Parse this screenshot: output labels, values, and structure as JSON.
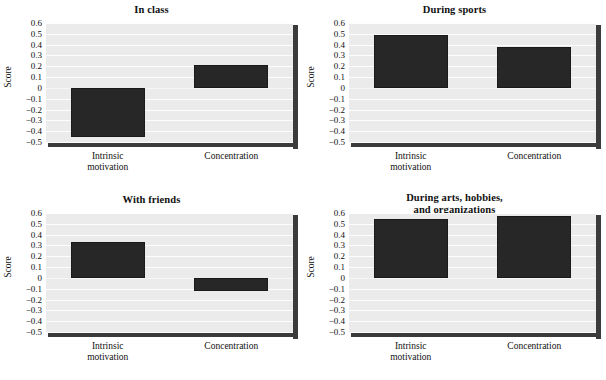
{
  "figure": {
    "background": "#ffffff",
    "plot_background": "#ebebeb",
    "bar_color": "#272727",
    "gridline_color": "#fdfdfd",
    "shadow_color": "#3b3b3b"
  },
  "chart_data": [
    {
      "type": "bar",
      "title": "In class",
      "title_lines": [
        "In class"
      ],
      "categories": [
        "Intrinsic motivation",
        "Concentration"
      ],
      "category_lines": [
        [
          "Intrinsic",
          "motivation"
        ],
        [
          "Concentration"
        ]
      ],
      "values": [
        -0.45,
        0.21
      ],
      "xlabel": "",
      "ylabel": "Score",
      "ylim": [
        -0.5,
        0.6
      ],
      "yticks": [
        0.6,
        0.5,
        0.4,
        0.3,
        0.2,
        0.1,
        0,
        -0.1,
        -0.2,
        -0.3,
        -0.4,
        -0.5
      ],
      "ytick_labels": [
        "0.6",
        "0.5",
        "0.4",
        "0.3",
        "0.2",
        "0.1",
        "0",
        "−0.1",
        "−0.2",
        "−0.3",
        "−0.4",
        "−0.5"
      ],
      "grid": true,
      "legend": false
    },
    {
      "type": "bar",
      "title": "During sports",
      "title_lines": [
        "During sports"
      ],
      "categories": [
        "Intrinsic motivation",
        "Concentration"
      ],
      "category_lines": [
        [
          "Intrinsic",
          "motivation"
        ],
        [
          "Concentration"
        ]
      ],
      "values": [
        0.49,
        0.38
      ],
      "xlabel": "",
      "ylabel": "Score",
      "ylim": [
        -0.5,
        0.6
      ],
      "yticks": [
        0.6,
        0.5,
        0.4,
        0.3,
        0.2,
        0.1,
        0,
        -0.1,
        -0.2,
        -0.3,
        -0.4,
        -0.5
      ],
      "ytick_labels": [
        "0.6",
        "0.5",
        "0.4",
        "0.3",
        "0.2",
        "0.1",
        "0",
        "−0.1",
        "−0.2",
        "−0.3",
        "−0.4",
        "−0.5"
      ],
      "grid": true,
      "legend": false
    },
    {
      "type": "bar",
      "title": "With friends",
      "title_lines": [
        "With friends"
      ],
      "categories": [
        "Intrinsic motivation",
        "Concentration"
      ],
      "category_lines": [
        [
          "Intrinsic",
          "motivation"
        ],
        [
          "Concentration"
        ]
      ],
      "values": [
        0.33,
        -0.12
      ],
      "xlabel": "",
      "ylabel": "Score",
      "ylim": [
        -0.5,
        0.6
      ],
      "yticks": [
        0.6,
        0.5,
        0.4,
        0.3,
        0.2,
        0.1,
        0,
        -0.1,
        -0.2,
        -0.3,
        -0.4,
        -0.5
      ],
      "ytick_labels": [
        "0.6",
        "0.5",
        "0.4",
        "0.3",
        "0.2",
        "0.1",
        "0",
        "−0.1",
        "−0.2",
        "−0.3",
        "−0.4",
        "−0.5"
      ],
      "grid": true,
      "legend": false
    },
    {
      "type": "bar",
      "title": "During arts, hobbies, and organizations",
      "title_lines": [
        "During arts, hobbies,",
        "and organizations"
      ],
      "categories": [
        "Intrinsic motivation",
        "Concentration"
      ],
      "category_lines": [
        [
          "Intrinsic",
          "motivation"
        ],
        [
          "Concentration"
        ]
      ],
      "values": [
        0.54,
        0.57
      ],
      "xlabel": "",
      "ylabel": "Score",
      "ylim": [
        -0.5,
        0.6
      ],
      "yticks": [
        0.6,
        0.5,
        0.4,
        0.3,
        0.2,
        0.1,
        0,
        -0.1,
        -0.2,
        -0.3,
        -0.4,
        -0.5
      ],
      "ytick_labels": [
        "0.6",
        "0.5",
        "0.4",
        "0.3",
        "0.2",
        "0.1",
        "0",
        "−0.1",
        "−0.2",
        "−0.3",
        "−0.4",
        "−0.5"
      ],
      "grid": true,
      "legend": false
    }
  ]
}
